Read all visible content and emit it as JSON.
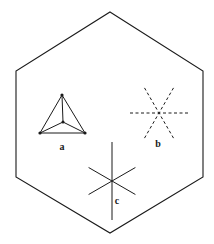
{
  "figure": {
    "background_color": "#ffffff",
    "stroke_color": "#1a1a1a",
    "label_color": "#1a1a1a",
    "width": 214,
    "height": 244,
    "outline": {
      "name": "hexagon",
      "sides": 6,
      "orientation": "pointy-top",
      "stroke_width": 1.1,
      "fill": "none",
      "vertices": [
        {
          "x": 110,
          "y": 12
        },
        {
          "x": 203,
          "y": 71
        },
        {
          "x": 203,
          "y": 177
        },
        {
          "x": 110,
          "y": 233
        },
        {
          "x": 16,
          "y": 177
        },
        {
          "x": 16,
          "y": 71
        }
      ]
    },
    "elements": [
      {
        "id": "a",
        "label": "a",
        "name": "tetrahedron",
        "description": "solid-line tetrahedron (triangular pyramid) in perspective",
        "label_x": 62,
        "label_y": 148,
        "stroke_width": 1.0,
        "line_style": "solid",
        "apex": {
          "x": 62,
          "y": 95
        },
        "base_left": {
          "x": 40,
          "y": 133
        },
        "base_right": {
          "x": 85,
          "y": 133
        },
        "base_back": {
          "x": 63,
          "y": 122
        },
        "vertex_dots": [
          {
            "x": 62,
            "y": 95
          },
          {
            "x": 40,
            "y": 133
          },
          {
            "x": 85,
            "y": 133
          },
          {
            "x": 63,
            "y": 122
          }
        ],
        "edges": [
          "apex-base_left",
          "apex-base_right",
          "apex-base_back",
          "base_left-base_right",
          "base_left-base_back",
          "base_right-base_back"
        ]
      },
      {
        "id": "b",
        "label": "b",
        "name": "dashed-six-fold-asterisk",
        "description": "six-pointed asterisk drawn with dashed lines (three crossing dashed axes)",
        "label_x": 158,
        "label_y": 145,
        "center": {
          "x": 159,
          "y": 113
        },
        "radius": 29,
        "stroke_width": 1.0,
        "line_style": "dashed",
        "dash_pattern": "3,2.5",
        "axis_angles_deg": [
          0,
          60,
          120
        ]
      },
      {
        "id": "c",
        "label": "c",
        "name": "solid-six-fold-asterisk",
        "description": "six-pointed asterisk drawn with solid lines, vertical axis longer",
        "label_x": 117,
        "label_y": 202,
        "center": {
          "x": 112,
          "y": 181
        },
        "radius": 27,
        "vertical_radius": 39,
        "stroke_width": 1.0,
        "line_style": "solid",
        "axis_angles_deg": [
          90,
          30,
          150
        ]
      }
    ]
  }
}
